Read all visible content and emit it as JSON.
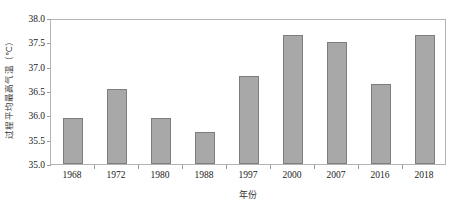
{
  "chart_data": {
    "type": "bar",
    "title": "",
    "subtitle": "",
    "xlabel": "年份",
    "ylabel": "过程平均最高气温（℃）",
    "categories": [
      "1968",
      "1972",
      "1980",
      "1988",
      "1997",
      "2000",
      "2007",
      "2016",
      "2018"
    ],
    "values": [
      35.95,
      36.55,
      35.95,
      35.65,
      36.8,
      37.65,
      37.5,
      36.65,
      37.65
    ],
    "series": [
      {
        "name": "过程平均最高气温",
        "values": [
          35.95,
          36.55,
          35.95,
          35.65,
          36.8,
          37.65,
          37.5,
          36.65,
          37.65
        ]
      }
    ],
    "ylim": [
      35.0,
      38.0
    ],
    "ytick_values": [
      35.0,
      35.5,
      36.0,
      36.5,
      37.0,
      37.5,
      38.0
    ],
    "ytick_labels": [
      "35.0",
      "35.5",
      "36.0",
      "36.5",
      "37.0",
      "37.5",
      "38.0"
    ],
    "grid": false,
    "legend": null,
    "legend_position": "none",
    "bar_color": "#a8a8a8",
    "bar_border_color": "#7d7d7d",
    "axis_color": "#b3b3b3",
    "background_color": "#ffffff"
  }
}
